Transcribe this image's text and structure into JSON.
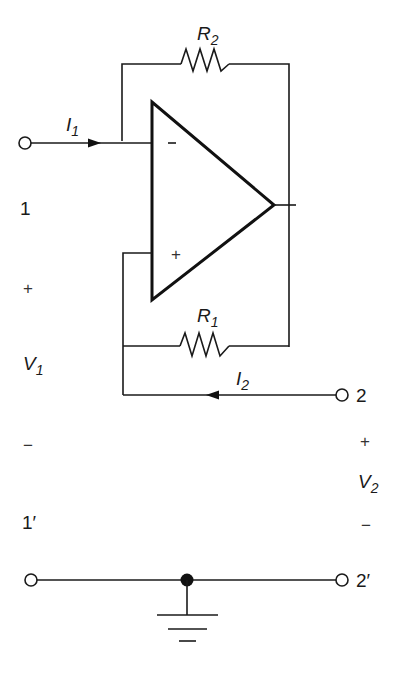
{
  "diagram": {
    "type": "op-amp two-port circuit (negative impedance converter)",
    "components": {
      "resistor_top": {
        "name": "R",
        "subscript": "2"
      },
      "resistor_bottom": {
        "name": "R",
        "subscript": "1"
      },
      "opamp": {
        "inverting_input": "−",
        "noninverting_input": "+"
      }
    },
    "currents": {
      "i1": {
        "name": "I",
        "subscript": "1"
      },
      "i2": {
        "name": "I",
        "subscript": "2"
      }
    },
    "ports": {
      "port1": "1",
      "port1_prime": "1′",
      "port2": "2",
      "port2_prime": "2′"
    },
    "voltages": {
      "v1": {
        "name": "V",
        "subscript": "1",
        "plus": "+",
        "minus": "−"
      },
      "v2": {
        "name": "V",
        "subscript": "2",
        "plus": "+",
        "minus": "−"
      }
    }
  }
}
